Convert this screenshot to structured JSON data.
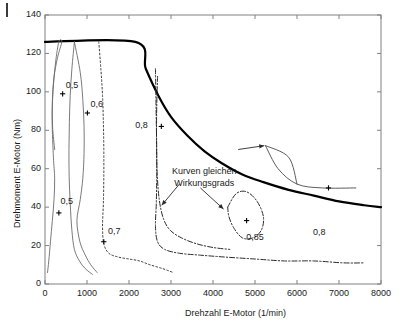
{
  "chart_data": {
    "type": "line",
    "title": "",
    "xlabel": "Drehzahl E-Motor (1/min)",
    "ylabel": "Drehmoment E-Motor (Nm)",
    "xlim": [
      0,
      8000
    ],
    "ylim": [
      0,
      140
    ],
    "xticks": [
      0,
      1000,
      2000,
      3000,
      4000,
      5000,
      6000,
      7000,
      8000
    ],
    "yticks": [
      0,
      20,
      40,
      60,
      80,
      100,
      120,
      140
    ],
    "xtick_labels": [
      "0",
      "1000",
      "2000",
      "3000",
      "4000",
      "5000",
      "6000",
      "7000",
      "8000"
    ],
    "ytick_labels": [
      "0",
      "20",
      "40",
      "60",
      "80",
      "100",
      "120",
      "140"
    ],
    "grid": false,
    "legend": "none",
    "annotations": [
      {
        "id": "efficiency-note",
        "text_line1": "Kurven gleichen",
        "text_line2": "Wirkungsgrads",
        "x": 3000,
        "y": 62
      }
    ],
    "contour_labels": [
      {
        "id": "eta-05-upper",
        "text": "0,5",
        "x": 420,
        "y": 100
      },
      {
        "id": "eta-06",
        "text": "0,6",
        "x": 1010,
        "y": 90
      },
      {
        "id": "eta-05-lower",
        "text": "0,5",
        "x": 320,
        "y": 40
      },
      {
        "id": "eta-07",
        "text": "0,7",
        "x": 1430,
        "y": 24
      },
      {
        "id": "eta-08-left",
        "text": "0,8",
        "x": 2580,
        "y": 82
      },
      {
        "id": "eta-085",
        "text": "0,85",
        "x": 4980,
        "y": 28
      },
      {
        "id": "eta-08-right",
        "text": "0,8",
        "x": 6620,
        "y": 31
      }
    ],
    "series": [
      {
        "name": "envelope-max-torque",
        "style": "solid-thick",
        "color": "#000000",
        "points": [
          [
            0,
            126
          ],
          [
            2150,
            126
          ],
          [
            2400,
            112
          ],
          [
            2700,
            98
          ],
          [
            3000,
            87
          ],
          [
            3400,
            77
          ],
          [
            3800,
            69
          ],
          [
            4200,
            63
          ],
          [
            4700,
            57
          ],
          [
            5200,
            53
          ],
          [
            5800,
            49
          ],
          [
            6400,
            46
          ],
          [
            7000,
            43
          ],
          [
            7600,
            41
          ],
          [
            8000,
            40
          ]
        ]
      },
      {
        "name": "eta-0.5-inner",
        "style": "solid-thin",
        "color": "#6b6b6b",
        "points": [
          [
            230,
            70
          ],
          [
            180,
            82
          ],
          [
            175,
            95
          ],
          [
            210,
            107
          ],
          [
            300,
            118
          ],
          [
            400,
            126
          ],
          [
            330,
            126
          ],
          [
            250,
            115
          ],
          [
            190,
            100
          ],
          [
            170,
            85
          ],
          [
            200,
            66
          ],
          [
            230,
            55
          ],
          [
            215,
            44
          ],
          [
            175,
            33
          ],
          [
            130,
            22
          ],
          [
            90,
            12
          ],
          [
            60,
            6
          ]
        ]
      },
      {
        "name": "eta-0.6-inner",
        "style": "solid-thin",
        "color": "#6b6b6b",
        "points": [
          [
            700,
            126
          ],
          [
            840,
            110
          ],
          [
            900,
            96
          ],
          [
            930,
            82
          ],
          [
            930,
            68
          ],
          [
            900,
            55
          ],
          [
            840,
            44
          ],
          [
            760,
            33
          ],
          [
            830,
            22
          ],
          [
            960,
            15
          ],
          [
            1090,
            10
          ],
          [
            1240,
            6
          ]
        ]
      },
      {
        "name": "eta-0.5-outer",
        "style": "solid-thin",
        "color": "#6b6b6b",
        "points": [
          [
            700,
            126
          ],
          [
            640,
            112
          ],
          [
            600,
            98
          ],
          [
            580,
            84
          ],
          [
            570,
            70
          ],
          [
            575,
            56
          ],
          [
            600,
            42
          ],
          [
            640,
            28
          ],
          [
            700,
            18
          ],
          [
            820,
            12
          ],
          [
            960,
            8
          ],
          [
            1130,
            5
          ]
        ]
      },
      {
        "name": "eta-0.7-dotted",
        "style": "dotted",
        "color": "#3a3a3a",
        "points": [
          [
            1280,
            126
          ],
          [
            1330,
            112
          ],
          [
            1370,
            98
          ],
          [
            1390,
            84
          ],
          [
            1400,
            70
          ],
          [
            1400,
            56
          ],
          [
            1390,
            42
          ],
          [
            1370,
            30
          ],
          [
            1400,
            21
          ],
          [
            1520,
            16
          ],
          [
            1750,
            14
          ],
          [
            2000,
            13
          ],
          [
            2250,
            12
          ],
          [
            2500,
            10
          ],
          [
            2800,
            8
          ],
          [
            3050,
            6
          ]
        ]
      },
      {
        "name": "eta-0.8-dashdot",
        "style": "dashdot",
        "color": "#2a2a2a",
        "points": [
          [
            2630,
            112
          ],
          [
            2640,
            98
          ],
          [
            2650,
            84
          ],
          [
            2660,
            70
          ],
          [
            2660,
            56
          ],
          [
            2650,
            42
          ],
          [
            2630,
            30
          ],
          [
            2680,
            22
          ],
          [
            2850,
            18
          ],
          [
            3200,
            16
          ],
          [
            3700,
            15
          ],
          [
            4300,
            14
          ],
          [
            5000,
            13
          ],
          [
            5700,
            12
          ],
          [
            6400,
            12
          ],
          [
            7100,
            11
          ],
          [
            7600,
            11
          ]
        ]
      },
      {
        "name": "eta-0.8-upper-arc",
        "style": "dashdot",
        "color": "#2a2a2a",
        "points": [
          [
            2680,
            108
          ],
          [
            2660,
            92
          ],
          [
            2655,
            74
          ],
          [
            2670,
            58
          ],
          [
            2720,
            44
          ],
          [
            2820,
            34
          ],
          [
            2980,
            28
          ],
          [
            3250,
            24
          ],
          [
            3600,
            21
          ],
          [
            4000,
            19
          ],
          [
            4400,
            18
          ]
        ]
      },
      {
        "name": "eta-0.85-closed",
        "style": "dashdot",
        "color": "#2a2a2a",
        "points": [
          [
            4350,
            40
          ],
          [
            4550,
            47
          ],
          [
            4800,
            48
          ],
          [
            5050,
            43
          ],
          [
            5200,
            35
          ],
          [
            5150,
            28
          ],
          [
            4950,
            24
          ],
          [
            4700,
            24
          ],
          [
            4500,
            29
          ],
          [
            4380,
            35
          ],
          [
            4350,
            40
          ]
        ]
      },
      {
        "name": "leader-upper-right",
        "style": "solid-thin",
        "color": "#4a4a4a",
        "points": [
          [
            5250,
            72
          ],
          [
            5550,
            60
          ],
          [
            6000,
            52
          ],
          [
            6600,
            50
          ],
          [
            7400,
            50
          ]
        ]
      },
      {
        "name": "leader-upper-right-branch",
        "style": "solid-thin",
        "color": "#4a4a4a",
        "points": [
          [
            5250,
            72
          ],
          [
            5800,
            66
          ],
          [
            6000,
            52
          ]
        ]
      }
    ],
    "markers": [
      {
        "id": "marker-eta-05-upper",
        "x": 420,
        "y": 99
      },
      {
        "id": "marker-eta-06",
        "x": 1010,
        "y": 89
      },
      {
        "id": "marker-eta-05-lower",
        "x": 330,
        "y": 37
      },
      {
        "id": "marker-eta-07",
        "x": 1400,
        "y": 22
      },
      {
        "id": "marker-eta-08-left",
        "x": 2770,
        "y": 82
      },
      {
        "id": "marker-eta-085",
        "x": 4800,
        "y": 33
      },
      {
        "id": "marker-eta-08-right",
        "x": 6750,
        "y": 50
      }
    ],
    "arrows": [
      {
        "id": "arrow-to-08-curve",
        "x1": 3200,
        "y1": 52,
        "x2": 2780,
        "y2": 41
      },
      {
        "id": "arrow-to-085-curve",
        "x1": 3700,
        "y1": 50,
        "x2": 4250,
        "y2": 39
      },
      {
        "id": "arrow-to-leader-right",
        "x1": 4600,
        "y1": 70,
        "x2": 5220,
        "y2": 72
      }
    ]
  },
  "figure": {
    "background": "#ffffff",
    "axis_color": "#808080",
    "text_color": "#1a1a1a",
    "envelope_color": "#000000",
    "contour_color": "#6b6b6b"
  }
}
